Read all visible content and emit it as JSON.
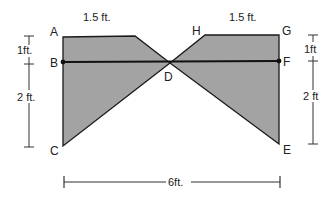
{
  "diagram": {
    "fill_color": "#a3a3a3",
    "stroke_color": "#1a1a1a",
    "points": {
      "A": "A",
      "B": "B",
      "C": "C",
      "D": "D",
      "E": "E",
      "F": "F",
      "G": "G",
      "H": "H"
    },
    "dimensions": {
      "top_left_width": "1.5 ft.",
      "top_right_width": "1.5 ft.",
      "left_upper_height": "1ft.",
      "left_lower_height": "2 ft.",
      "right_upper_height": "1ft",
      "right_lower_height": "2 ft",
      "total_width": "6ft."
    }
  }
}
